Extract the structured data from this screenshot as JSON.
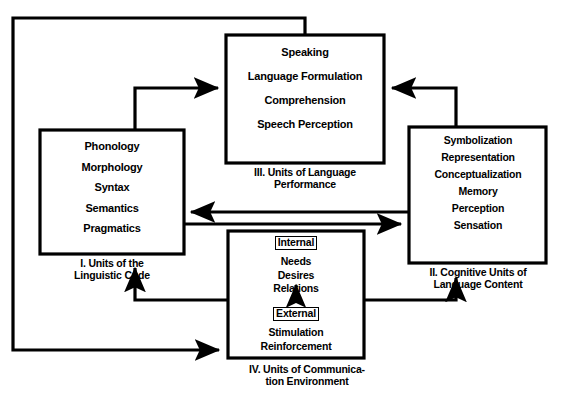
{
  "figure": {
    "type": "diagram",
    "title_fragment": "",
    "background_color": "#ffffff",
    "line_color": "#000000"
  },
  "boxes": {
    "box1": {
      "id": "I",
      "caption": "I. Units of the\nLinguistic Code",
      "caption_line1": "I. Units of the",
      "caption_line2": "Linguistic Code",
      "items": [
        "Phonology",
        "Morphology",
        "Syntax",
        "Semantics",
        "Pragmatics"
      ]
    },
    "box2": {
      "id": "II",
      "caption": "II. Cognitive Units of\nLanguage Content",
      "caption_line1": "II. Cognitive Units of",
      "caption_line2": "Language Content",
      "items": [
        "Symbolization",
        "Representation",
        "Conceptualization",
        "Memory",
        "Perception",
        "Sensation"
      ]
    },
    "box3": {
      "id": "III",
      "caption": "III. Units of Language\nPerformance",
      "caption_line1": "III. Units of Language",
      "caption_line2": "Performance",
      "items": [
        "Speaking",
        "Language Formulation",
        "Comprehension",
        "Speech Perception"
      ]
    },
    "box4": {
      "id": "IV",
      "caption": "IV. Units of Communica-\ntion Environment",
      "caption_line1": "IV. Units of Communica-",
      "caption_line2": "tion Environment",
      "internal": {
        "label": "Internal",
        "items": [
          "Needs",
          "Desires",
          "Relations"
        ]
      },
      "external": {
        "label": "External",
        "items": [
          "Stimulation",
          "Reinforcement"
        ]
      }
    }
  },
  "arrows": [
    {
      "name": "box1-to-box3",
      "from": "I",
      "to": "III",
      "direction": "up-right"
    },
    {
      "name": "box2-to-box3",
      "from": "II",
      "to": "III",
      "direction": "up-left"
    },
    {
      "name": "box2-to-box1",
      "from": "II",
      "to": "I",
      "direction": "left"
    },
    {
      "name": "box1-to-box2",
      "from": "I",
      "to": "II",
      "direction": "right"
    },
    {
      "name": "box4-to-box1",
      "from": "IV",
      "to": "I",
      "direction": "up"
    },
    {
      "name": "box4-to-box2",
      "from": "IV",
      "to": "II",
      "direction": "up"
    },
    {
      "name": "box3-to-box4",
      "from": "III",
      "to": "IV",
      "direction": "down-right-around"
    },
    {
      "name": "external-to-internal",
      "from": "External",
      "to": "Internal",
      "direction": "up"
    }
  ]
}
